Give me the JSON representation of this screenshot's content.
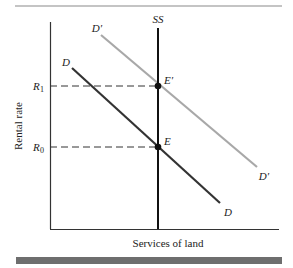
{
  "diagram": {
    "type": "supply-demand",
    "axes": {
      "ylabel": "Rental rate",
      "xlabel": "Services of land"
    },
    "price_levels": [
      {
        "id": "R1",
        "label": "R",
        "subscript": "1"
      },
      {
        "id": "R0",
        "label": "R",
        "subscript": "0"
      }
    ],
    "curves": {
      "supply": {
        "label": "SS",
        "kind": "vertical",
        "color": "#111111"
      },
      "demand_original": {
        "label": "D",
        "end_label": "D",
        "color": "#333333"
      },
      "demand_shifted": {
        "label": "D′",
        "end_label": "D′",
        "color": "#a8a8a8"
      }
    },
    "equilibria": [
      {
        "id": "E_prime",
        "label": "E′",
        "price_level": "R1"
      },
      {
        "id": "E",
        "label": "E",
        "price_level": "R0"
      }
    ],
    "colors": {
      "axis": "#333333",
      "rule_top": "#8a8a8a",
      "bar_bottom": "#6e6e6e",
      "dashed": "#333333"
    }
  }
}
